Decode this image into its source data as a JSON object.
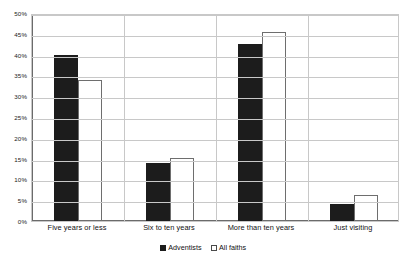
{
  "chart_data": {
    "type": "bar",
    "title": "",
    "subtitle": "",
    "xlabel": "",
    "ylabel": "",
    "categories": [
      "Five years or less",
      "Six to ten years",
      "More than ten years",
      "Just visiting"
    ],
    "series": [
      {
        "name": "Adventists",
        "color": "#1c1c1c",
        "values": [
          40.0,
          14.0,
          42.5,
          4.2
        ]
      },
      {
        "name": "All faiths",
        "color": "#ffffff",
        "values": [
          34.0,
          15.2,
          45.5,
          6.3
        ]
      }
    ],
    "ylim": [
      0,
      50
    ],
    "ytick_step": 5,
    "ytick_labels": [
      "50%",
      "45%",
      "40%",
      "35%",
      "30%",
      "25%",
      "20%",
      "15%",
      "10%",
      "5%",
      "0%"
    ],
    "ytick_values": [
      50,
      45,
      40,
      35,
      30,
      25,
      20,
      15,
      10,
      5,
      0
    ],
    "grid": true,
    "grid_axis": "y",
    "legend_position": "bottom",
    "value_suffix": "%"
  },
  "legend": {
    "items": [
      {
        "label": "Adventists"
      },
      {
        "label": "All faiths"
      }
    ]
  }
}
